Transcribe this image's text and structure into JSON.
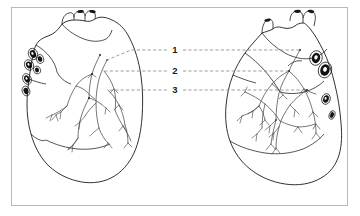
{
  "figure": {
    "background_color": "#ffffff",
    "frame_color": "#b9b9b9",
    "ink_color": "#1b1b1b",
    "vessel_color": "#4a4a4a",
    "leader_color": "#8c8c8c",
    "frame": {
      "x": 11,
      "y": 7,
      "width": 337,
      "height": 199
    }
  },
  "labels": [
    {
      "id": "label-1",
      "text": "1",
      "x": 175,
      "y": 50
    },
    {
      "id": "label-2",
      "text": "2",
      "x": 175,
      "y": 71
    },
    {
      "id": "label-3",
      "text": "3",
      "x": 175,
      "y": 90
    }
  ],
  "leader_lines": [
    {
      "id": "leader-1-left",
      "label": "1",
      "side": "left",
      "points": "167,50 131,50 107,60"
    },
    {
      "id": "leader-1-right",
      "label": "1",
      "side": "right",
      "points": "183,50 300,50"
    },
    {
      "id": "leader-2-left",
      "label": "2",
      "side": "left",
      "points": "167,71 104,71"
    },
    {
      "id": "leader-2-right",
      "label": "2",
      "side": "right",
      "points": "183,71 289,71"
    },
    {
      "id": "leader-3-left",
      "label": "3",
      "side": "left",
      "points": "167,90 108,90"
    },
    {
      "id": "leader-3-right",
      "label": "3",
      "side": "right",
      "points": "183,90 307,90"
    }
  ],
  "hearts": [
    {
      "id": "heart-left",
      "name": "heart-anterior-view",
      "center_x": 85,
      "vein_openings": 6,
      "vessel_branches": 14
    },
    {
      "id": "heart-right",
      "name": "heart-posterior-view",
      "center_x": 280,
      "vein_openings": 4,
      "vessel_branches": 16
    }
  ]
}
